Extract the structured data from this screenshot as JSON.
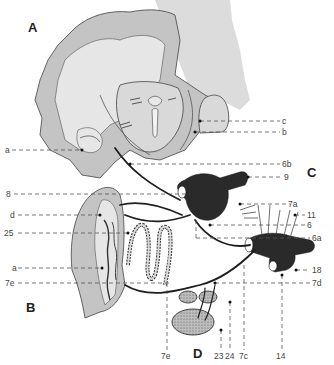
{
  "figure": {
    "panels": [
      {
        "id": "A",
        "label": "A"
      },
      {
        "id": "B",
        "label": "B"
      },
      {
        "id": "C",
        "label": "C"
      },
      {
        "id": "D",
        "label": "D"
      }
    ],
    "labels_left": [
      {
        "id": "a_A",
        "text": "a"
      },
      {
        "id": "8",
        "text": "8"
      },
      {
        "id": "d",
        "text": "d"
      },
      {
        "id": "25",
        "text": "25"
      },
      {
        "id": "a_B",
        "text": "a"
      },
      {
        "id": "7e_left",
        "text": "7e"
      }
    ],
    "labels_right": [
      {
        "id": "c",
        "text": "c"
      },
      {
        "id": "b",
        "text": "b"
      },
      {
        "id": "6b",
        "text": "6b"
      },
      {
        "id": "9",
        "text": "9"
      },
      {
        "id": "7a",
        "text": "7a"
      },
      {
        "id": "11",
        "text": "11"
      },
      {
        "id": "6",
        "text": "6"
      },
      {
        "id": "6a",
        "text": "6a"
      },
      {
        "id": "18",
        "text": "18"
      },
      {
        "id": "7d",
        "text": "7d"
      }
    ],
    "labels_bottom": [
      {
        "id": "7e_bottom",
        "text": "7e"
      },
      {
        "id": "23",
        "text": "23"
      },
      {
        "id": "24",
        "text": "24"
      },
      {
        "id": "7c",
        "text": "7c"
      },
      {
        "id": "14",
        "text": "14"
      }
    ]
  }
}
